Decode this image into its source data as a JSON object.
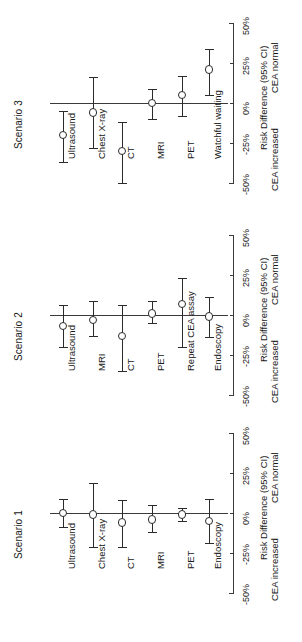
{
  "figure": {
    "orientation": "rotated-90-ccw",
    "panels_label": "Scenario panels"
  },
  "axis": {
    "title": "Risk Difference (95% CI)",
    "left_side_label": "CEA increased",
    "right_side_label": "CEA normal",
    "ticks": [
      "-50%",
      "-25%",
      "0%",
      "25%",
      "50%"
    ],
    "tick_values": [
      -50,
      -25,
      0,
      25,
      50
    ],
    "limits": [
      -50,
      50
    ]
  },
  "panels": [
    {
      "id": "scenario3",
      "title": "Scenario 3"
    },
    {
      "id": "scenario2",
      "title": "Scenario 2"
    },
    {
      "id": "scenario1",
      "title": "Scenario 1"
    }
  ],
  "chart_data": {
    "type": "scatter",
    "title": "",
    "subtitle": "",
    "xlabel": "",
    "ylabel": "Risk Difference (95% CI)",
    "ylim": [
      -50,
      50
    ],
    "ytick_labels": [
      "-50%",
      "-25%",
      "0%",
      "25%",
      "50%"
    ],
    "grid": false,
    "legend": "none",
    "annotations": [
      "CEA increased",
      "CEA normal"
    ],
    "reference_line": 0,
    "panels": [
      {
        "name": "Scenario 3",
        "categories": [
          "Ultrasound",
          "Chest X-ray",
          "CT",
          "MRI",
          "PET",
          "Watchful waiting"
        ],
        "values": [
          -20,
          -6,
          -30,
          0,
          5,
          21
        ],
        "ci_low": [
          -37,
          -28,
          -50,
          -10,
          -8,
          5
        ],
        "ci_high": [
          -5,
          16,
          -12,
          9,
          17,
          34
        ]
      },
      {
        "name": "Scenario 2",
        "categories": [
          "Ultrasound",
          "MRI",
          "CT",
          "PET",
          "Repeat CEA assay",
          "Endoscopy"
        ],
        "values": [
          -7,
          -3,
          -13,
          1,
          7,
          -1
        ],
        "ci_low": [
          -20,
          -13,
          -35,
          -5,
          -20,
          -14
        ],
        "ci_high": [
          6,
          9,
          6,
          9,
          23,
          11
        ]
      },
      {
        "name": "Scenario 1",
        "categories": [
          "Ultrasound",
          "Chest X-ray",
          "CT",
          "MRI",
          "PET",
          "Endoscopy"
        ],
        "values": [
          0,
          -1,
          -6,
          -4,
          -1,
          -5
        ],
        "ci_low": [
          -9,
          -21,
          -21,
          -12,
          -5,
          -19
        ],
        "ci_high": [
          9,
          19,
          8,
          5,
          3,
          9
        ]
      }
    ]
  }
}
